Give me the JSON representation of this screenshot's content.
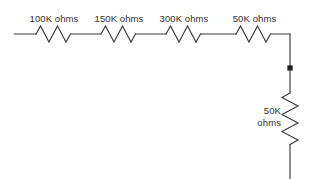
{
  "diagram": {
    "colors": {
      "line": "#3a3a3a",
      "text": "#2f2f2f",
      "background": "#ffffff",
      "junction": "#1a1a1a"
    },
    "series_resistors": [
      {
        "name": "resistor-1",
        "label": "100K ohms",
        "value": "100K",
        "unit": "ohms",
        "x": 54,
        "label_y": 13
      },
      {
        "name": "resistor-2",
        "label": "150K ohms",
        "value": "150K",
        "unit": "ohms",
        "x": 119,
        "label_y": 13
      },
      {
        "name": "resistor-3",
        "label": "300K ohms",
        "value": "300K",
        "unit": "ohms",
        "x": 184,
        "label_y": 13
      },
      {
        "name": "resistor-4",
        "label": "50K ohms",
        "value": "50K",
        "unit": "ohms",
        "x": 254,
        "label_y": 13
      }
    ],
    "shunt_resistor": {
      "name": "resistor-5",
      "label_line1": "50K",
      "label_line2": "ohms",
      "value": "50K",
      "unit": "ohms"
    },
    "junction": {
      "name": "junction-node",
      "x": 290,
      "y": 68
    }
  }
}
